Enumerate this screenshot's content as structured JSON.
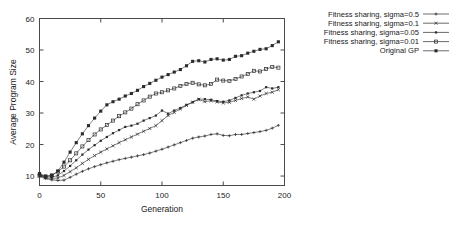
{
  "chart_data": {
    "type": "line",
    "title": "",
    "xlabel": "Generation",
    "ylabel": "Average Program Size",
    "xlim": [
      0,
      200
    ],
    "ylim": [
      7,
      60
    ],
    "xticks": [
      0,
      50,
      100,
      150,
      200
    ],
    "yticks": [
      10,
      20,
      30,
      40,
      50,
      60
    ],
    "grid": false,
    "legend_position": "right-outside",
    "x": [
      0,
      5,
      10,
      15,
      20,
      25,
      30,
      35,
      40,
      45,
      50,
      55,
      60,
      65,
      70,
      75,
      80,
      85,
      90,
      95,
      100,
      105,
      110,
      115,
      120,
      125,
      130,
      135,
      140,
      145,
      150,
      155,
      160,
      165,
      170,
      175,
      180,
      185,
      190,
      195
    ],
    "series": [
      {
        "name": "Fitness sharing, sigma=0.5",
        "marker": "plus",
        "values": [
          10.0,
          9.2,
          8.8,
          8.6,
          8.7,
          9.6,
          10.6,
          11.5,
          12.3,
          13.0,
          13.6,
          14.2,
          14.7,
          15.2,
          15.6,
          16.0,
          16.4,
          16.8,
          17.3,
          17.9,
          18.5,
          19.2,
          19.9,
          20.6,
          21.3,
          22.0,
          22.4,
          22.7,
          23.2,
          23.4,
          22.9,
          22.8,
          23.2,
          23.2,
          23.5,
          23.8,
          24.1,
          24.5,
          25.2,
          26.1
        ]
      },
      {
        "name": "Fitness sharing, sigma=0.1",
        "marker": "cross",
        "values": [
          10.0,
          9.4,
          9.2,
          9.4,
          10.2,
          11.4,
          12.6,
          14.0,
          15.3,
          16.5,
          17.6,
          18.6,
          19.6,
          20.6,
          21.5,
          22.4,
          23.3,
          24.2,
          25.1,
          26.0,
          27.6,
          29.2,
          30.2,
          31.3,
          32.4,
          33.5,
          34.3,
          33.6,
          33.9,
          33.5,
          33.2,
          33.4,
          34.0,
          34.6,
          35.1,
          34.4,
          35.4,
          36.2,
          36.6,
          37.4
        ]
      },
      {
        "name": "Fitness sharing, sigma=0.05",
        "marker": "dot",
        "values": [
          10.4,
          9.8,
          9.6,
          10.2,
          11.6,
          13.2,
          15.0,
          16.8,
          18.4,
          19.8,
          21.2,
          22.4,
          23.6,
          24.6,
          25.6,
          26.0,
          26.6,
          27.6,
          28.4,
          29.2,
          30.8,
          29.8,
          30.8,
          31.6,
          32.6,
          33.4,
          34.4,
          34.4,
          34.2,
          33.8,
          33.6,
          34.0,
          34.8,
          35.6,
          36.2,
          36.6,
          37.0,
          38.2,
          37.8,
          38.2
        ]
      },
      {
        "name": "Fitness sharing, sigma=0.01",
        "marker": "open-square",
        "values": [
          10.2,
          9.8,
          10.2,
          11.4,
          13.0,
          15.0,
          17.2,
          19.4,
          21.4,
          23.2,
          24.8,
          26.2,
          27.6,
          29.0,
          30.2,
          31.4,
          32.8,
          34.0,
          35.2,
          36.2,
          36.6,
          37.2,
          37.8,
          38.6,
          39.2,
          39.6,
          39.1,
          38.8,
          39.2,
          40.6,
          40.3,
          40.2,
          40.8,
          41.6,
          42.4,
          43.4,
          43.2,
          44.0,
          44.6,
          44.4
        ]
      },
      {
        "name": "Original GP",
        "marker": "filled-square",
        "values": [
          10.8,
          10.0,
          10.2,
          11.6,
          14.4,
          17.6,
          20.6,
          23.4,
          26.0,
          28.4,
          30.6,
          32.6,
          33.6,
          34.4,
          35.4,
          36.2,
          37.2,
          38.4,
          39.4,
          40.4,
          41.4,
          42.2,
          43.0,
          43.8,
          45.0,
          46.4,
          46.6,
          46.2,
          47.0,
          47.2,
          46.8,
          47.0,
          48.0,
          48.2,
          49.0,
          49.6,
          50.2,
          50.4,
          51.4,
          52.6
        ]
      }
    ]
  },
  "legend": {
    "entries": [
      {
        "label": "Fitness sharing, sigma=0.5"
      },
      {
        "label": "Fitness sharing, sigma=0.1"
      },
      {
        "label": "Fitness sharing, sigma=0.05"
      },
      {
        "label": "Fitness sharing, sigma=0.01"
      },
      {
        "label": "Original GP"
      }
    ]
  },
  "axes": {
    "x_title": "Generation",
    "y_title": "Average Program Size",
    "x_tick_labels": [
      "0",
      "50",
      "100",
      "150",
      "200"
    ],
    "y_tick_labels": [
      "10",
      "20",
      "30",
      "40",
      "50",
      "60"
    ]
  },
  "colors": {
    "line": "#2b2b2b",
    "axis": "#4a4a4a",
    "text": "#1a1a1a",
    "background": "#ffffff"
  }
}
